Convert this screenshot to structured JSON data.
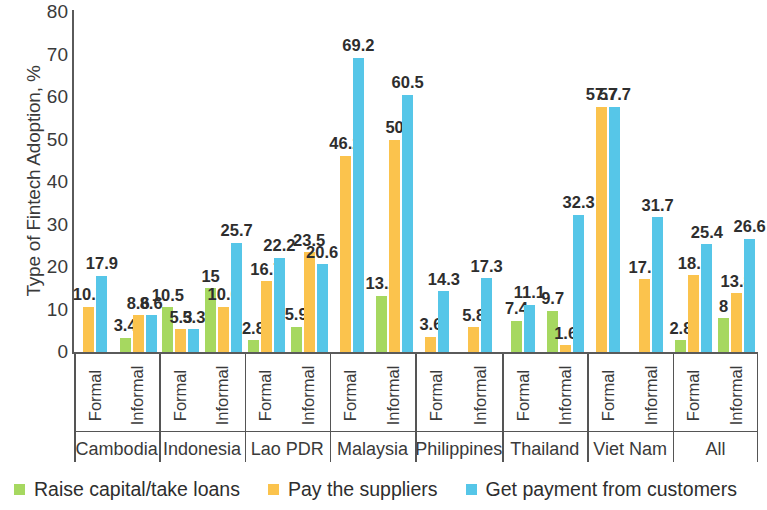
{
  "chart_data": {
    "type": "bar",
    "title": "",
    "xlabel": "",
    "ylabel": "Type of Fintech Adoption, %",
    "ylim": [
      0,
      80
    ],
    "yticks": [
      0,
      10,
      20,
      30,
      40,
      50,
      60,
      70,
      80
    ],
    "grid": false,
    "legend_position": "bottom",
    "colors": {
      "raise_capital": "#a6d860",
      "pay_suppliers": "#fbc34d",
      "get_payment": "#56c6e8"
    },
    "legend": [
      {
        "key": "raise_capital",
        "label": "Raise capital/take loans",
        "color": "#a6d860"
      },
      {
        "key": "pay_suppliers",
        "label": "Pay the suppliers",
        "color": "#fbc34d"
      },
      {
        "key": "get_payment",
        "label": "Get payment from customers",
        "color": "#56c6e8"
      }
    ],
    "series": [
      {
        "name": "Raise capital/take loans",
        "values": [
          null,
          3.4,
          10.5,
          15,
          2.8,
          5.9,
          null,
          13.2,
          null,
          null,
          7.4,
          9.7,
          null,
          2.8,
          2.8,
          8
        ]
      },
      {
        "name": "Pay the suppliers",
        "values": [
          10.7,
          8.6,
          5.3,
          10.6,
          16.7,
          23.5,
          46.2,
          50,
          3.6,
          5.8,
          null,
          1.6,
          57.7,
          17.1,
          18.1,
          13.8
        ]
      },
      {
        "name": "Get payment from customers",
        "values": [
          17.9,
          8.6,
          5.3,
          25.7,
          22.2,
          20.6,
          69.2,
          60.5,
          14.3,
          17.3,
          11.1,
          32.3,
          57.7,
          31.7,
          25.4,
          26.6
        ]
      }
    ],
    "groups": [
      {
        "country": "Cambodia",
        "subgroups": [
          {
            "label": "Formal",
            "bars": [
              {
                "key": "pay_suppliers",
                "value": 10.7,
                "label": "10.7"
              },
              {
                "key": "get_payment",
                "value": 17.9,
                "label": "17.9"
              }
            ]
          },
          {
            "label": "Informal",
            "bars": [
              {
                "key": "raise_capital",
                "value": 3.4,
                "label": "3.4"
              },
              {
                "key": "pay_suppliers",
                "value": 8.6,
                "label": "8.6"
              },
              {
                "key": "get_payment",
                "value": 8.6,
                "label": "8.6"
              }
            ]
          }
        ]
      },
      {
        "country": "Indonesia",
        "subgroups": [
          {
            "label": "Formal",
            "bars": [
              {
                "key": "raise_capital",
                "value": 10.5,
                "label": "10.5"
              },
              {
                "key": "pay_suppliers",
                "value": 5.3,
                "label": "5.3"
              },
              {
                "key": "get_payment",
                "value": 5.3,
                "label": "5.3"
              }
            ]
          },
          {
            "label": "Informal",
            "bars": [
              {
                "key": "raise_capital",
                "value": 15,
                "label": "15"
              },
              {
                "key": "pay_suppliers",
                "value": 10.6,
                "label": "10.6"
              },
              {
                "key": "get_payment",
                "value": 25.7,
                "label": "25.7"
              }
            ]
          }
        ]
      },
      {
        "country": "Lao PDR",
        "subgroups": [
          {
            "label": "Formal",
            "bars": [
              {
                "key": "raise_capital",
                "value": 2.8,
                "label": "2.8"
              },
              {
                "key": "pay_suppliers",
                "value": 16.7,
                "label": "16.7"
              },
              {
                "key": "get_payment",
                "value": 22.2,
                "label": "22.2"
              }
            ]
          },
          {
            "label": "Informal",
            "bars": [
              {
                "key": "raise_capital",
                "value": 5.9,
                "label": "5.9"
              },
              {
                "key": "pay_suppliers",
                "value": 23.5,
                "label": "23.5"
              },
              {
                "key": "get_payment",
                "value": 20.6,
                "label": "20.6"
              }
            ]
          }
        ]
      },
      {
        "country": "Malaysia",
        "subgroups": [
          {
            "label": "Formal",
            "bars": [
              {
                "key": "pay_suppliers",
                "value": 46.2,
                "label": "46.2"
              },
              {
                "key": "get_payment",
                "value": 69.2,
                "label": "69.2"
              }
            ]
          },
          {
            "label": "Informal",
            "bars": [
              {
                "key": "raise_capital",
                "value": 13.2,
                "label": "13.2"
              },
              {
                "key": "pay_suppliers",
                "value": 50,
                "label": "50"
              },
              {
                "key": "get_payment",
                "value": 60.5,
                "label": "60.5"
              }
            ]
          }
        ]
      },
      {
        "country": "Philippines",
        "subgroups": [
          {
            "label": "Formal",
            "bars": [
              {
                "key": "pay_suppliers",
                "value": 3.6,
                "label": "3.6"
              },
              {
                "key": "get_payment",
                "value": 14.3,
                "label": "14.3"
              }
            ]
          },
          {
            "label": "Informal",
            "bars": [
              {
                "key": "pay_suppliers",
                "value": 5.8,
                "label": "5.8"
              },
              {
                "key": "get_payment",
                "value": 17.3,
                "label": "17.3"
              }
            ]
          }
        ]
      },
      {
        "country": "Thailand",
        "subgroups": [
          {
            "label": "Formal",
            "bars": [
              {
                "key": "raise_capital",
                "value": 7.4,
                "label": "7.4"
              },
              {
                "key": "get_payment",
                "value": 11.1,
                "label": "11.1"
              }
            ]
          },
          {
            "label": "Informal",
            "bars": [
              {
                "key": "raise_capital",
                "value": 9.7,
                "label": "9.7"
              },
              {
                "key": "pay_suppliers",
                "value": 1.6,
                "label": "1.6"
              },
              {
                "key": "get_payment",
                "value": 32.3,
                "label": "32.3"
              }
            ]
          }
        ]
      },
      {
        "country": "Viet Nam",
        "subgroups": [
          {
            "label": "Formal",
            "bars": [
              {
                "key": "pay_suppliers",
                "value": 57.7,
                "label": "57.7"
              },
              {
                "key": "get_payment",
                "value": 57.7,
                "label": "57.7"
              }
            ]
          },
          {
            "label": "Informal",
            "bars": [
              {
                "key": "pay_suppliers",
                "value": 17.1,
                "label": "17.1"
              },
              {
                "key": "get_payment",
                "value": 31.7,
                "label": "31.7"
              }
            ]
          }
        ]
      },
      {
        "country": "All",
        "subgroups": [
          {
            "label": "Formal",
            "bars": [
              {
                "key": "raise_capital",
                "value": 2.8,
                "label": "2.8"
              },
              {
                "key": "pay_suppliers",
                "value": 18.1,
                "label": "18.1"
              },
              {
                "key": "get_payment",
                "value": 25.4,
                "label": "25.4"
              }
            ]
          },
          {
            "label": "Informal",
            "bars": [
              {
                "key": "raise_capital",
                "value": 8,
                "label": "8"
              },
              {
                "key": "pay_suppliers",
                "value": 13.8,
                "label": "13.8"
              },
              {
                "key": "get_payment",
                "value": 26.6,
                "label": "26.6"
              }
            ]
          }
        ]
      }
    ]
  }
}
